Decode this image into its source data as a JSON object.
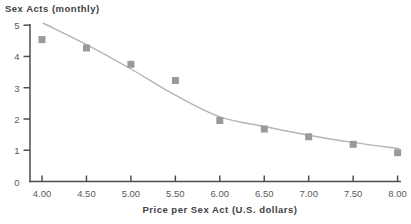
{
  "chart_data": {
    "type": "scatter",
    "title": "Sex Acts (monthly)",
    "xlabel": "Price per Sex Act (U.S. dollars)",
    "ylabel": "Sex Acts (monthly)",
    "xlim": [
      4.0,
      8.0
    ],
    "ylim": [
      0,
      5
    ],
    "grid": false,
    "legend": null,
    "x_ticks": [
      {
        "value": 4.0,
        "label": "4.00"
      },
      {
        "value": 4.5,
        "label": "4.50"
      },
      {
        "value": 5.0,
        "label": "5.00"
      },
      {
        "value": 5.5,
        "label": "5.50"
      },
      {
        "value": 6.0,
        "label": "6.00"
      },
      {
        "value": 6.5,
        "label": "6.50"
      },
      {
        "value": 7.0,
        "label": "7.00"
      },
      {
        "value": 7.5,
        "label": "7.50"
      },
      {
        "value": 8.0,
        "label": "8.00"
      }
    ],
    "y_ticks": [
      {
        "value": 0,
        "label": "0"
      },
      {
        "value": 1,
        "label": "1"
      },
      {
        "value": 2,
        "label": "2"
      },
      {
        "value": 3,
        "label": "3"
      },
      {
        "value": 4,
        "label": "4"
      },
      {
        "value": 5,
        "label": "5"
      }
    ],
    "series": [
      {
        "name": "observed sex acts",
        "marker": "square",
        "points": [
          {
            "x": 4.0,
            "y": 4.54
          },
          {
            "x": 4.5,
            "y": 4.27
          },
          {
            "x": 5.0,
            "y": 3.75
          },
          {
            "x": 5.5,
            "y": 3.23
          },
          {
            "x": 6.0,
            "y": 1.95
          },
          {
            "x": 6.5,
            "y": 1.68
          },
          {
            "x": 7.0,
            "y": 1.43
          },
          {
            "x": 7.5,
            "y": 1.19
          },
          {
            "x": 8.0,
            "y": 0.92
          }
        ]
      }
    ],
    "trend_curve": {
      "name": "fitted demand curve",
      "points": [
        [
          4.01,
          5.07
        ],
        [
          4.5,
          4.38
        ],
        [
          5.0,
          3.6
        ],
        [
          5.5,
          2.76
        ],
        [
          6.0,
          2.07
        ],
        [
          6.5,
          1.76
        ],
        [
          7.0,
          1.48
        ],
        [
          7.5,
          1.25
        ],
        [
          8.02,
          1.05
        ]
      ]
    },
    "colors": {
      "marker": "#9a9a9a",
      "curve": "#b4b4b4",
      "axis": "#4d4e50",
      "tick_text": "#595a5c",
      "label_text": "#414245"
    }
  }
}
